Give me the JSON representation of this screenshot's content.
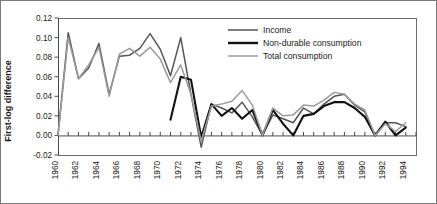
{
  "chart_data": {
    "type": "line",
    "title": "",
    "xlabel": "",
    "ylabel": "First-log difference",
    "ylim": [
      -0.02,
      0.12
    ],
    "yticks": [
      "-0.02",
      "0.00",
      "0.02",
      "0.04",
      "0.06",
      "0.08",
      "0.10",
      "0.12"
    ],
    "ytick_values": [
      -0.02,
      0.0,
      0.02,
      0.04,
      0.06,
      0.08,
      0.1,
      0.12
    ],
    "xlim": [
      1960,
      1995
    ],
    "xticks": [
      "1960",
      "1962",
      "1964",
      "1966",
      "1968",
      "1970",
      "1972",
      "1974",
      "1976",
      "1978",
      "1980",
      "1982",
      "1984",
      "1986",
      "1988",
      "1990",
      "1992",
      "1994"
    ],
    "xtick_values": [
      1960,
      1962,
      1964,
      1966,
      1968,
      1970,
      1972,
      1974,
      1976,
      1978,
      1980,
      1982,
      1984,
      1986,
      1988,
      1990,
      1992,
      1994
    ],
    "grid": false,
    "legend_position": "top-right",
    "x": [
      1960,
      1961,
      1962,
      1963,
      1964,
      1965,
      1966,
      1967,
      1968,
      1969,
      1970,
      1971,
      1972,
      1973,
      1974,
      1975,
      1976,
      1977,
      1978,
      1979,
      1980,
      1981,
      1982,
      1983,
      1984,
      1985,
      1986,
      1987,
      1988,
      1989,
      1990,
      1991,
      1992,
      1993,
      1994
    ],
    "series": [
      {
        "name": "Income",
        "color": "#555555",
        "width": 1.5,
        "x": [
          1960,
          1961,
          1962,
          1963,
          1964,
          1965,
          1966,
          1967,
          1968,
          1969,
          1970,
          1971,
          1972,
          1973,
          1974,
          1975,
          1976,
          1977,
          1978,
          1979,
          1980,
          1981,
          1982,
          1983,
          1984,
          1985,
          1986,
          1987,
          1988,
          1989,
          1990,
          1991,
          1992,
          1993,
          1994
        ],
        "values": [
          0.0,
          0.105,
          0.058,
          0.069,
          0.094,
          0.042,
          0.081,
          0.082,
          0.089,
          0.104,
          0.088,
          0.061,
          0.1,
          0.042,
          -0.012,
          0.032,
          0.028,
          0.023,
          0.034,
          0.019,
          0.0,
          0.021,
          0.017,
          0.013,
          0.028,
          0.022,
          0.032,
          0.04,
          0.042,
          0.031,
          0.024,
          0.0,
          0.013,
          0.013,
          0.009
        ]
      },
      {
        "name": "Non-durable consumption",
        "color": "#121212",
        "width": 2.1,
        "x": [
          1971,
          1972,
          1973,
          1974,
          1975,
          1976,
          1977,
          1978,
          1979,
          1980,
          1981,
          1982,
          1983,
          1984,
          1985,
          1986,
          1987,
          1988,
          1989,
          1990,
          1991,
          1992,
          1993,
          1994
        ],
        "values": [
          0.016,
          0.06,
          0.057,
          -0.002,
          0.032,
          0.02,
          0.028,
          0.017,
          0.026,
          0.0,
          0.026,
          0.012,
          0.0,
          0.02,
          0.022,
          0.03,
          0.034,
          0.034,
          0.028,
          0.019,
          0.0,
          0.014,
          0.0,
          0.008
        ]
      },
      {
        "name": "Total consumption",
        "color": "#9b9b9b",
        "width": 1.5,
        "x": [
          1960,
          1961,
          1962,
          1963,
          1964,
          1965,
          1966,
          1967,
          1968,
          1969,
          1970,
          1971,
          1972,
          1973,
          1974,
          1975,
          1976,
          1977,
          1978,
          1979,
          1980,
          1981,
          1982,
          1983,
          1984,
          1985,
          1986,
          1987,
          1988,
          1989,
          1990,
          1991,
          1992,
          1993,
          1994
        ],
        "values": [
          0.0,
          0.1,
          0.058,
          0.072,
          0.09,
          0.04,
          0.083,
          0.089,
          0.081,
          0.09,
          0.078,
          0.054,
          0.072,
          0.042,
          -0.006,
          0.03,
          0.032,
          0.035,
          0.046,
          0.031,
          0.0,
          0.028,
          0.02,
          0.021,
          0.031,
          0.03,
          0.036,
          0.044,
          0.042,
          0.032,
          0.026,
          0.0,
          0.012,
          0.004,
          0.013
        ]
      }
    ],
    "legend": [
      {
        "label": "Income",
        "color": "#555555",
        "width": 1.5
      },
      {
        "label": "Non-durable consumption",
        "color": "#121212",
        "width": 2.4
      },
      {
        "label": "Total consumption",
        "color": "#9b9b9b",
        "width": 1.5
      }
    ]
  }
}
